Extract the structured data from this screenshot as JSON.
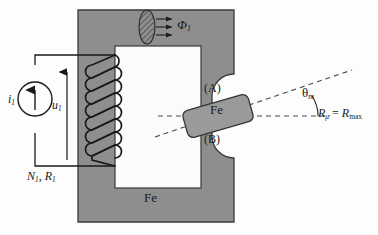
{
  "figure": {
    "type": "schematic-diagram"
  },
  "colors": {
    "core_fill": "#8e8e8e",
    "core_stroke": "#3a3a3a",
    "window_fill": "#fbfbfb",
    "rotor_fill": "#9a9a9a",
    "rotor_stroke": "#333333",
    "wire": "#1a1a1a",
    "dashed": "#4a4a4a",
    "text": "#1a1a1a",
    "background": "#fdfdfd"
  },
  "labels": {
    "flux": {
      "symbol": "Φ",
      "sub": "1",
      "name": "magnetic-flux"
    },
    "current_source": {
      "symbol": "i",
      "sub": "1",
      "name": "source-current"
    },
    "voltage": {
      "symbol": "u",
      "sub": "1",
      "name": "terminal-voltage"
    },
    "winding": {
      "text_n": "N",
      "sub_n": "1",
      "sep": ", ",
      "text_r": "R",
      "sub_r": "1"
    },
    "core_material": "Fe",
    "rotor_material": "Fe",
    "pole_a": "(A)",
    "pole_b": "(B)",
    "angle": {
      "symbol": "θ",
      "sub": "m"
    },
    "reluctance": {
      "lhs": "R",
      "lhs_sub": "μ",
      "eq": "=",
      "rhs": "R",
      "rhs_sub": "max"
    }
  },
  "geometry": {
    "core": {
      "outer_x": 78,
      "outer_y": 10,
      "outer_w": 156,
      "outer_h": 212
    },
    "rotor": {
      "cx": 218,
      "cy": 116,
      "length": 68,
      "width": 27,
      "angle_deg": -16
    },
    "coil_turns": 5,
    "flux_arrows": 3
  }
}
